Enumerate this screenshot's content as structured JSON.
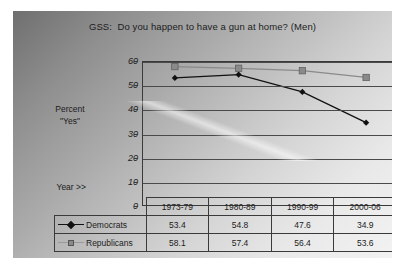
{
  "slide": {
    "title": "GSS:  Do you happen to have a gun at home? (Men)",
    "y_axis_title_line1": "Percent",
    "y_axis_title_line2": "\"Yes\"",
    "year_label": "Year >>"
  },
  "colors": {
    "democrats": "#111111",
    "republicans": "#8a8a8a",
    "axis": "#3a3a3a",
    "text": "#1c1c1c"
  },
  "icons": {
    "democrats_marker": "diamond-marker-icon",
    "republicans_marker": "square-marker-icon"
  },
  "chart_data": {
    "type": "line",
    "title": "GSS:  Do you happen to have a gun at home? (Men)",
    "xlabel": "",
    "ylabel": "Percent \"Yes\"",
    "categories": [
      "1973-79",
      "1980-89",
      "1990-99",
      "2000-06"
    ],
    "series": [
      {
        "name": "Democrats",
        "values": [
          53.4,
          54.8,
          47.6,
          34.9
        ],
        "marker": "diamond",
        "color": "#111111"
      },
      {
        "name": "Republicans",
        "values": [
          58.1,
          57.4,
          56.4,
          53.6
        ],
        "marker": "square",
        "color": "#8a8a8a"
      }
    ],
    "ylim": [
      0,
      60
    ],
    "yticks": [
      0,
      10,
      20,
      30,
      40,
      50,
      60
    ],
    "ytick_labels": [
      "0",
      "10",
      "20",
      "30",
      "40",
      "50",
      "60"
    ],
    "grid": true,
    "legend": "data-table-below"
  },
  "table": {
    "headers": [
      "1973-79",
      "1980-89",
      "1990-99",
      "2000-06"
    ],
    "rows": [
      {
        "label": "Democrats",
        "values": [
          "53.4",
          "54.8",
          "47.6",
          "34.9"
        ]
      },
      {
        "label": "Republicans",
        "values": [
          "58.1",
          "57.4",
          "56.4",
          "53.6"
        ]
      }
    ]
  }
}
